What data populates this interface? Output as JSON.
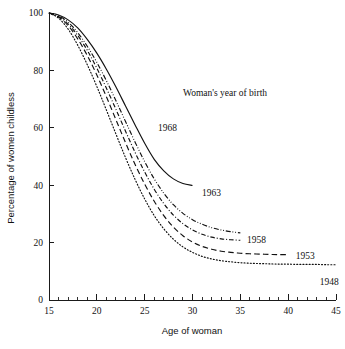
{
  "chart_data": {
    "type": "line",
    "title": "",
    "xlabel": "Age of woman",
    "ylabel": "Percentage of women childless",
    "xlim": [
      15,
      45
    ],
    "ylim": [
      0,
      100
    ],
    "grid": false,
    "legend_position": "inline-labels",
    "legend_title": "Woman's year of birth",
    "x_ticks_major": [
      15,
      20,
      25,
      30,
      35,
      40,
      45
    ],
    "x_ticks_major_labels": [
      "15",
      "20",
      "25",
      "30",
      "35",
      "40",
      "45"
    ],
    "x_tick_minor_step": 1,
    "y_ticks_major": [
      0,
      20,
      40,
      60,
      80,
      100
    ],
    "y_ticks_major_labels": [
      "0",
      "20",
      "40",
      "60",
      "80",
      "100"
    ],
    "series": [
      {
        "name": "1968",
        "label": "1968",
        "style": "solid",
        "x": [
          15,
          16,
          17,
          18,
          19,
          20,
          21,
          22,
          23,
          24,
          25,
          26,
          27,
          28,
          29,
          30
        ],
        "values": [
          100,
          99.3,
          97.6,
          94.8,
          90.8,
          86.0,
          80.4,
          74.2,
          67.6,
          61.0,
          54.6,
          49.0,
          45.0,
          42.2,
          40.6,
          39.9
        ]
      },
      {
        "name": "1963",
        "label": "1963",
        "style": "dash-dot-dot",
        "x": [
          15,
          16,
          17,
          18,
          19,
          20,
          21,
          22,
          23,
          24,
          25,
          26,
          27,
          28,
          29,
          30,
          31,
          32,
          33,
          34,
          35
        ],
        "values": [
          100,
          99.0,
          96.8,
          93.2,
          88.4,
          82.8,
          76.4,
          69.4,
          62.2,
          55.0,
          48.2,
          42.2,
          37.2,
          33.2,
          30.2,
          28.0,
          26.4,
          25.2,
          24.4,
          23.8,
          23.4
        ]
      },
      {
        "name": "1958",
        "label": "1958",
        "style": "dash-dot",
        "x": [
          15,
          16,
          17,
          18,
          19,
          20,
          21,
          22,
          23,
          24,
          25,
          26,
          27,
          28,
          29,
          30,
          31,
          32,
          33,
          34,
          35
        ],
        "values": [
          100,
          98.8,
          96.2,
          92.2,
          87.0,
          80.8,
          73.8,
          66.4,
          58.8,
          51.4,
          44.6,
          38.6,
          33.6,
          29.6,
          26.6,
          24.4,
          22.9,
          21.9,
          21.3,
          21.0,
          20.8
        ]
      },
      {
        "name": "1953",
        "label": "1953",
        "style": "dashed",
        "x": [
          15,
          16,
          17,
          18,
          19,
          20,
          21,
          22,
          23,
          24,
          25,
          26,
          27,
          28,
          29,
          30,
          31,
          32,
          33,
          34,
          35,
          36,
          37,
          38,
          39,
          40
        ],
        "values": [
          100,
          98.6,
          95.6,
          91.0,
          85.2,
          78.4,
          70.8,
          62.8,
          54.8,
          47.2,
          40.4,
          34.4,
          29.4,
          25.4,
          22.4,
          20.2,
          18.7,
          17.7,
          17.0,
          16.6,
          16.3,
          16.1,
          16.0,
          15.9,
          15.8,
          15.8
        ]
      },
      {
        "name": "1948",
        "label": "1948",
        "style": "dotted",
        "x": [
          15,
          16,
          17,
          18,
          19,
          20,
          21,
          22,
          23,
          24,
          25,
          26,
          27,
          28,
          29,
          30,
          31,
          32,
          33,
          34,
          35,
          36,
          37,
          38,
          39,
          40,
          41,
          42,
          43,
          44,
          45
        ],
        "values": [
          100,
          98.2,
          94.4,
          88.8,
          82.0,
          74.4,
          66.2,
          57.8,
          49.6,
          42.0,
          35.2,
          29.4,
          24.8,
          21.2,
          18.5,
          16.6,
          15.2,
          14.3,
          13.7,
          13.3,
          13.0,
          12.8,
          12.7,
          12.6,
          12.5,
          12.5,
          12.4,
          12.4,
          12.4,
          12.3,
          12.3
        ]
      }
    ],
    "series_label_positions": [
      {
        "name": "1968",
        "x": 26.4,
        "y": 60.0
      },
      {
        "name": "1963",
        "x": 31.0,
        "y": 37.5
      },
      {
        "name": "1958",
        "x": 35.7,
        "y": 21.2
      },
      {
        "name": "1953",
        "x": 40.8,
        "y": 15.6
      },
      {
        "name": "1948",
        "x": 43.3,
        "y": 6.5
      }
    ]
  }
}
